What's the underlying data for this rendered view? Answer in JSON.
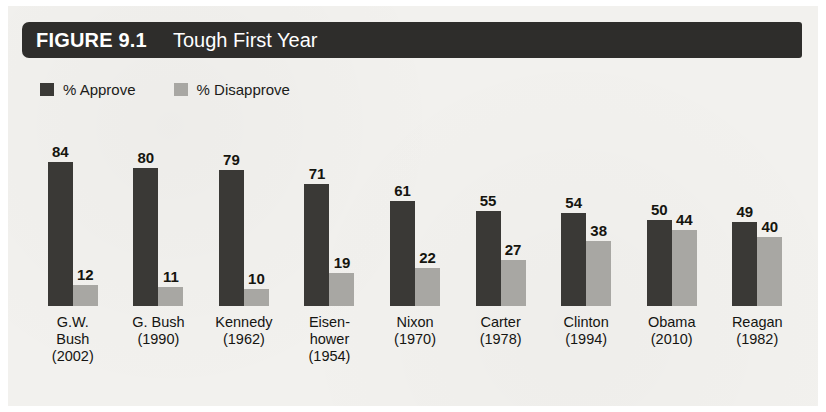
{
  "figure": {
    "number_label": "FIGURE 9.1",
    "title": "Tough First Year"
  },
  "legend": {
    "items": [
      {
        "label": "% Approve",
        "color": "#3a3936",
        "key": "approve"
      },
      {
        "label": "% Disapprove",
        "color": "#a8a7a3",
        "key": "disapprove"
      }
    ]
  },
  "chart_data": {
    "type": "bar",
    "title": "Tough First Year",
    "xlabel": "",
    "ylabel": "",
    "ylim": [
      0,
      100
    ],
    "grid": false,
    "legend_position": "top-left",
    "categories": [
      "G.W. Bush (2002)",
      "G. Bush (1990)",
      "Kennedy (1962)",
      "Eisenhower (1954)",
      "Nixon (1970)",
      "Carter (1978)",
      "Clinton (1994)",
      "Obama (2010)",
      "Reagan (1982)"
    ],
    "category_lines": [
      [
        "G.W.",
        "Bush",
        "(2002)"
      ],
      [
        "G. Bush",
        "(1990)"
      ],
      [
        "Kennedy",
        "(1962)"
      ],
      [
        "Eisen-",
        "hower",
        "(1954)"
      ],
      [
        "Nixon",
        "(1970)"
      ],
      [
        "Carter",
        "(1978)"
      ],
      [
        "Clinton",
        "(1994)"
      ],
      [
        "Obama",
        "(2010)"
      ],
      [
        "Reagan",
        "(1982)"
      ]
    ],
    "series": [
      {
        "name": "% Approve",
        "color": "#3a3936",
        "values": [
          84,
          80,
          79,
          71,
          61,
          55,
          54,
          50,
          49
        ]
      },
      {
        "name": "% Disapprove",
        "color": "#a8a7a3",
        "values": [
          12,
          11,
          10,
          19,
          22,
          27,
          38,
          44,
          40
        ]
      }
    ]
  }
}
